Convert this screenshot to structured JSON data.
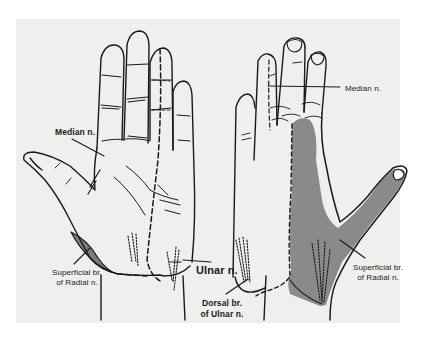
{
  "figure": {
    "colors": {
      "background": "#ffffff",
      "panel": "#efefed",
      "outline": "#1a1a1a",
      "radial_shading": "#8a8a8a",
      "radial_patch_palm": "#7d7d7d"
    },
    "palmar_view": {
      "labels": {
        "median": "Median n.",
        "superficial_radial_line1": "Superficial br.",
        "superficial_radial_line2": "of Radial n.",
        "ulnar": "Ulnar n."
      }
    },
    "dorsal_view": {
      "labels": {
        "median": "Median n.",
        "dorsal_ulnar_line1": "Dorsal br.",
        "dorsal_ulnar_line2": "of Ulnar n.",
        "superficial_radial_line1": "Superficial br.",
        "superficial_radial_line2": "of Radial n."
      }
    }
  }
}
